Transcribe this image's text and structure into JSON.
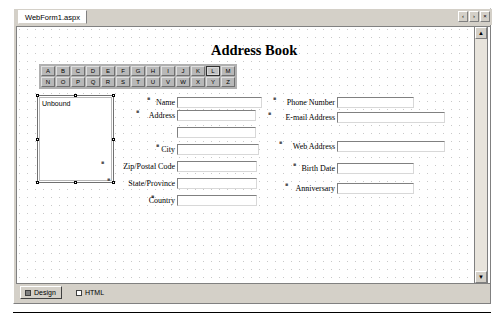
{
  "window": {
    "tab_label": "WebForm1.aspx",
    "nav_prev": "‹",
    "nav_next": "›",
    "nav_close": "×"
  },
  "page": {
    "title": "Address Book",
    "listbox_value": "Unbound"
  },
  "alphabet": {
    "row1": [
      "A",
      "B",
      "C",
      "D",
      "E",
      "F",
      "G",
      "H",
      "I",
      "J",
      "K",
      "L",
      "M"
    ],
    "row2": [
      "N",
      "O",
      "P",
      "Q",
      "R",
      "S",
      "T",
      "U",
      "V",
      "W",
      "X",
      "Y",
      "Z"
    ],
    "selected": "L"
  },
  "left_fields": [
    {
      "label": "Name",
      "value": "",
      "marker": "■"
    },
    {
      "label": "Address",
      "value": "",
      "marker": "■"
    },
    {
      "label": "",
      "value": "",
      "marker": ""
    },
    {
      "label": "City",
      "value": "",
      "marker": "■"
    },
    {
      "label": "Zip/Postal Code",
      "value": "",
      "marker": "■"
    },
    {
      "label": "State/Province",
      "value": "",
      "marker": "■"
    },
    {
      "label": "Country",
      "value": "",
      "marker": "■"
    }
  ],
  "right_fields": [
    {
      "label": "Phone Number",
      "value": "",
      "marker": "■"
    },
    {
      "label": "E-mail Address",
      "value": "",
      "marker": "■"
    },
    {
      "label": "Web Address",
      "value": "",
      "marker": "■"
    },
    {
      "label": "Birth Date",
      "value": "",
      "marker": "■"
    },
    {
      "label": "Anniversary",
      "value": "",
      "marker": "■"
    }
  ],
  "viewbar": {
    "design_label": "Design",
    "html_label": "HTML"
  },
  "scrollbar": {
    "up_arrow": "▲",
    "down_arrow": "▼"
  },
  "colors": {
    "chrome": "#d4d0c8",
    "canvas": "#ffffff",
    "grid_dot": "#c8c8c8",
    "button_face": "#b8b8b8"
  }
}
